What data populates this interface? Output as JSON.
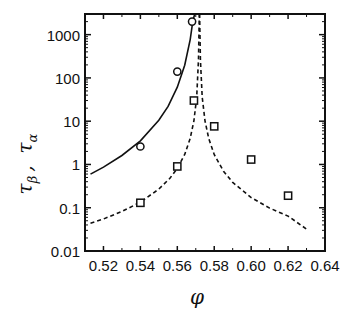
{
  "chart_data": {
    "type": "scatter",
    "title": "",
    "xlabel": "φ",
    "ylabel": "τβ , τα",
    "ylabel_parts": {
      "tau1": "τ",
      "sub1": "β",
      "sep": ",",
      "tau2": "τ",
      "sub2": "α"
    },
    "xscale": "linear",
    "yscale": "log",
    "xlim": [
      0.51,
      0.64
    ],
    "ylim": [
      0.01,
      3000
    ],
    "grid": false,
    "legend": null,
    "x_ticks": [
      0.52,
      0.54,
      0.56,
      0.58,
      0.6,
      0.62,
      0.64
    ],
    "x_tick_labels": [
      "0.52",
      "0.54",
      "0.56",
      "0.58",
      "0.60",
      "0.62",
      "0.64"
    ],
    "y_ticks": [
      0.01,
      0.1,
      1,
      10,
      100,
      1000
    ],
    "y_tick_labels": [
      "0.01",
      "0.1",
      "1",
      "10",
      "100",
      "1000"
    ],
    "series": [
      {
        "name": "tau_alpha data",
        "marker": "circle",
        "x": [
          0.54,
          0.56,
          0.568
        ],
        "y": [
          2.6,
          140,
          2000
        ]
      },
      {
        "name": "tau_beta data",
        "marker": "square",
        "x": [
          0.54,
          0.56,
          0.569,
          0.58,
          0.6,
          0.62
        ],
        "y": [
          0.13,
          0.9,
          30,
          7.6,
          1.3,
          0.19
        ]
      },
      {
        "name": "tau_alpha fit",
        "style": "solid",
        "x": [
          0.513,
          0.52,
          0.53,
          0.54,
          0.55,
          0.555,
          0.56,
          0.564,
          0.567,
          0.5685,
          0.5695
        ],
        "y": [
          0.6,
          0.87,
          1.61,
          3.5,
          10.5,
          22,
          61,
          197,
          770,
          2180,
          3000
        ]
      },
      {
        "name": "tau_beta fit (left branch)",
        "style": "dashed",
        "x": [
          0.513,
          0.52,
          0.53,
          0.54,
          0.55,
          0.556,
          0.56,
          0.564,
          0.567,
          0.569,
          0.5705,
          0.5715,
          0.5719
        ],
        "y": [
          0.044,
          0.055,
          0.082,
          0.135,
          0.27,
          0.48,
          0.81,
          1.7,
          4.0,
          10.2,
          36,
          270,
          3000
        ]
      },
      {
        "name": "tau_beta fit (right branch)",
        "style": "dashed",
        "x": [
          0.5721,
          0.5725,
          0.5735,
          0.575,
          0.577,
          0.58,
          0.585,
          0.59,
          0.6,
          0.61,
          0.62,
          0.631
        ],
        "y": [
          3000,
          270,
          36,
          10.2,
          4.0,
          1.7,
          0.7,
          0.385,
          0.171,
          0.098,
          0.064,
          0.03
        ]
      }
    ]
  }
}
